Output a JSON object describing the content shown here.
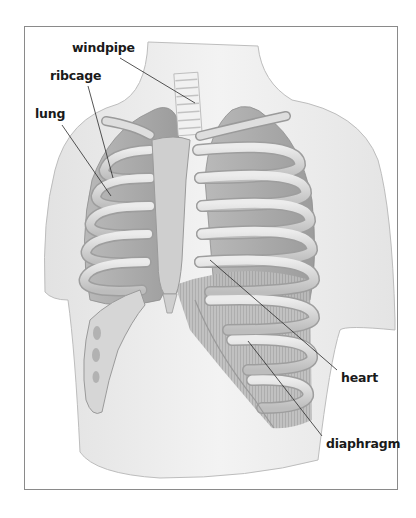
{
  "figure": {
    "type": "anatomical-diagram",
    "labels": [
      {
        "id": "windpipe",
        "text": "windpipe",
        "x": 72,
        "y": 42,
        "leader": {
          "x1": 120,
          "y1": 58,
          "x2": 195,
          "y2": 103
        }
      },
      {
        "id": "ribcage",
        "text": "ribcage",
        "x": 50,
        "y": 70,
        "leader": {
          "x1": 88,
          "y1": 86,
          "x2": 113,
          "y2": 178
        }
      },
      {
        "id": "lung",
        "text": "lung",
        "x": 35,
        "y": 108,
        "leader": {
          "x1": 62,
          "y1": 125,
          "x2": 111,
          "y2": 196
        }
      },
      {
        "id": "heart",
        "text": "heart",
        "x": 341,
        "y": 372,
        "leader": {
          "x1": 210,
          "y1": 260,
          "x2": 337,
          "y2": 370
        }
      },
      {
        "id": "diaphragm",
        "text": "diaphragm",
        "x": 326,
        "y": 438,
        "leader": {
          "x1": 248,
          "y1": 341,
          "x2": 322,
          "y2": 436
        }
      }
    ]
  },
  "colors": {
    "skin": "#ececec",
    "skin_outline": "#b9b9b9",
    "bone": "#d9d9d9",
    "bone_shadow": "#a7a7a7",
    "lung": "#c4c4c4",
    "diaphragm": "#b5b5b5",
    "leader": "#2a2a2a",
    "frame": "#8a8a8a",
    "text": "#1a1a1a"
  }
}
